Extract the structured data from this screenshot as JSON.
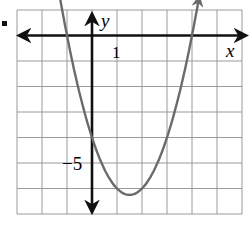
{
  "problem_marker": "■",
  "chart_data": {
    "type": "line",
    "title": "",
    "xlabel": "x",
    "ylabel": "y",
    "xlim": [
      -3,
      6
    ],
    "ylim": [
      -7,
      1
    ],
    "grid": true,
    "tick_labels": [
      {
        "axis": "x",
        "value": 1,
        "label": "1"
      },
      {
        "axis": "y",
        "value": -5,
        "label": "−5"
      }
    ],
    "series": [
      {
        "name": "parabola",
        "equation": "y = x^2 - 3x - 4",
        "color": "#6b6b6b",
        "vertex": [
          1.5,
          -6.25
        ],
        "x_intercepts": [
          -1,
          4
        ],
        "y_intercept": -4,
        "x": [
          -1.75,
          -1,
          0,
          1,
          1.5,
          2,
          3,
          4,
          4.75
        ],
        "y": [
          4.31,
          0,
          -4,
          -6,
          -6.25,
          -6,
          -4,
          0,
          4.31
        ],
        "arrows_both_ends": true
      }
    ],
    "colors": {
      "axis": "#111111",
      "grid": "#9a9a9a",
      "curve": "#6b6b6b"
    }
  }
}
